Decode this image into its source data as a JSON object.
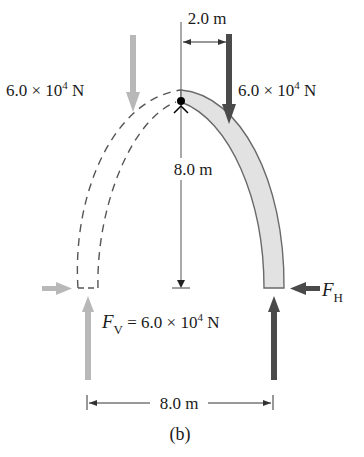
{
  "figure": {
    "caption": "(b)",
    "colors": {
      "dark_arrow": "#4a4a4a",
      "light_arrow": "#b8b8b8",
      "arch_fill": "#e2e2e2",
      "arch_stroke": "#6a6a6a",
      "dim_line": "#333333",
      "pivot": "#000000"
    }
  },
  "labels": {
    "top_dimension": "2.0 m",
    "left_load": {
      "value": "6.0 × 10",
      "exp": "4",
      "unit": " N"
    },
    "right_load": {
      "value": "6.0 × 10",
      "exp": "4",
      "unit": " N"
    },
    "height_dimension": "8.0 m",
    "horizontal_force": {
      "symbol": "F",
      "sub": "H"
    },
    "vertical_force": {
      "symbol": "F",
      "sub": "V",
      "eq": " = 6.0 × 10",
      "exp": "4",
      "unit": " N"
    },
    "base_dimension": "8.0 m"
  },
  "arrows": [
    {
      "name": "left-applied-load",
      "direction": "down",
      "shade": "light"
    },
    {
      "name": "right-applied-load",
      "direction": "down",
      "shade": "dark"
    },
    {
      "name": "left-horizontal-reaction",
      "direction": "right",
      "shade": "light"
    },
    {
      "name": "right-horizontal-reaction",
      "direction": "left",
      "shade": "dark"
    },
    {
      "name": "left-vertical-reaction",
      "direction": "up",
      "shade": "light"
    },
    {
      "name": "right-vertical-reaction",
      "direction": "up",
      "shade": "dark"
    }
  ]
}
